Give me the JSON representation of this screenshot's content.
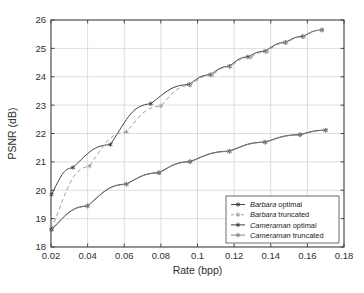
{
  "chart_data": {
    "type": "line",
    "title": "",
    "xlabel": "Rate (bpp)",
    "ylabel": "PSNR (dB)",
    "xlim": [
      0.02,
      0.18
    ],
    "ylim": [
      18,
      26
    ],
    "xticks": [
      "0.02",
      "0.04",
      "0.06",
      "0.08",
      "0.1",
      "0.12",
      "0.14",
      "0.16",
      "0.18"
    ],
    "xtick_values": [
      0.02,
      0.04,
      0.06,
      0.08,
      0.1,
      0.12,
      0.14,
      0.16,
      0.18
    ],
    "yticks": [
      "18",
      "19",
      "20",
      "21",
      "22",
      "23",
      "24",
      "25",
      "26"
    ],
    "ytick_values": [
      18,
      19,
      20,
      21,
      22,
      23,
      24,
      25,
      26
    ],
    "grid": true,
    "legend_position": "lower right",
    "series": [
      {
        "name": "Barbara optimal",
        "name_italic_part": "Barbara",
        "name_plain_part": "optimal",
        "style": "solid",
        "marker": "star",
        "color": "#3a3a3a",
        "x": [
          0.0203,
          0.032,
          0.0525,
          0.0745,
          0.0955,
          0.107,
          0.1175,
          0.1275,
          0.137,
          0.148,
          0.1575,
          0.168
        ],
        "y": [
          19.85,
          20.8,
          21.61,
          23.05,
          23.73,
          24.07,
          24.37,
          24.7,
          24.9,
          25.21,
          25.42,
          25.65
        ]
      },
      {
        "name": "Barbara truncated",
        "name_italic_part": "Barbara",
        "name_plain_part": "truncated",
        "style": "dashed",
        "marker": "star",
        "color": "#9a9a9a",
        "x": [
          0.0203,
          0.041,
          0.0612,
          0.08,
          0.096,
          0.108,
          0.118,
          0.129,
          0.138,
          0.1485,
          0.158,
          0.168
        ],
        "y": [
          18.63,
          20.85,
          22.06,
          22.97,
          23.7,
          24.06,
          24.36,
          24.69,
          24.89,
          25.2,
          25.41,
          25.64
        ]
      },
      {
        "name": "Cameraman optimal",
        "name_italic_part": "Cameraman",
        "name_plain_part": "optimal",
        "style": "solid",
        "marker": "star",
        "color": "#3a3a3a",
        "x": [
          0.0203,
          0.04,
          0.0612,
          0.079,
          0.096,
          0.1175,
          0.137,
          0.156,
          0.17
        ],
        "y": [
          18.62,
          19.45,
          20.22,
          20.62,
          21.01,
          21.38,
          21.7,
          21.96,
          22.12
        ]
      },
      {
        "name": "Cameraman truncated",
        "name_italic_part": "Cameraman",
        "name_plain_part": "truncated",
        "style": "solid",
        "marker": "star",
        "color": "#7d7d7d",
        "x": [
          0.0203,
          0.04,
          0.0612,
          0.079,
          0.096,
          0.1175,
          0.137,
          0.156,
          0.17
        ],
        "y": [
          18.6,
          19.44,
          20.21,
          20.61,
          21.0,
          21.37,
          21.69,
          21.95,
          22.11
        ]
      }
    ]
  },
  "axes": {
    "xlabel": "Rate (bpp)",
    "ylabel": "PSNR (dB)"
  },
  "legend": {
    "items": [
      {
        "italic": "Barbara",
        "plain": "optimal"
      },
      {
        "italic": "Barbara",
        "plain": "truncated"
      },
      {
        "italic": "Cameraman",
        "plain": "optimal"
      },
      {
        "italic": "Cameraman",
        "plain": "truncated"
      }
    ]
  },
  "colors": {
    "axis": "#3a3a3a",
    "grid": "#cfcfcf",
    "background": "#ffffff",
    "series_dark": "#3a3a3a",
    "series_light": "#9a9a9a"
  }
}
